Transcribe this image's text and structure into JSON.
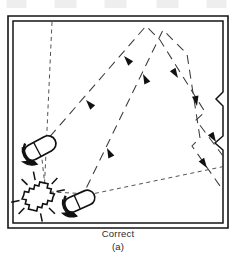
{
  "figure": {
    "caption_main": "Correct",
    "caption_sub": "(a)",
    "type": "lighting-plan-diagram"
  },
  "colors": {
    "ink": "#1a1a1a",
    "wall": "#141414",
    "ray": "#3a3a3a",
    "background": "#ffffff",
    "caption": "#2b2b2b"
  },
  "room": {
    "name": "room-outline",
    "outer": {
      "x": 8,
      "y": 16,
      "width": 220,
      "height": 212
    },
    "inner": {
      "x": 12,
      "y": 20,
      "width": 212,
      "height": 204
    },
    "wall_style": "double-line",
    "wall_notches": [
      {
        "name": "right-wall-notch-upper",
        "y": 96,
        "depth": 7
      },
      {
        "name": "right-wall-notch-lower",
        "y": 140,
        "depth": 7
      }
    ]
  },
  "fixtures": [
    {
      "name": "spotlight-upper-left",
      "label": "spotlight",
      "x": 40,
      "y": 148,
      "rotation": -28,
      "aim": "up-right"
    },
    {
      "name": "spotlight-lower-center",
      "label": "spotlight",
      "x": 80,
      "y": 201,
      "rotation": -24,
      "aim": "up-right"
    }
  ],
  "glare_source": {
    "name": "sparkle-lamp",
    "label": "bright-source",
    "x": 38,
    "y": 196,
    "rotation": -30
  },
  "rays": [
    {
      "name": "ray-path-upper",
      "kind": "reflected-beam",
      "points": [
        [
          40,
          148
        ],
        [
          146,
          26
        ],
        [
          160,
          40
        ],
        [
          205,
          112
        ],
        [
          196,
          120
        ],
        [
          226,
          160
        ]
      ],
      "arrows": [
        {
          "x": 86,
          "y": 100,
          "angle": -49
        },
        {
          "x": 122,
          "y": 58,
          "angle": -49
        },
        {
          "x": 176,
          "y": 76,
          "angle": 58
        },
        {
          "x": 214,
          "y": 140,
          "angle": 58
        }
      ]
    },
    {
      "name": "ray-path-lower",
      "kind": "reflected-beam",
      "points": [
        [
          80,
          201
        ],
        [
          163,
          30
        ],
        [
          187,
          54
        ],
        [
          200,
          138
        ],
        [
          192,
          146
        ],
        [
          220,
          186
        ]
      ],
      "arrows": [
        {
          "x": 108,
          "y": 146,
          "angle": -64
        },
        {
          "x": 142,
          "y": 76,
          "angle": -64
        },
        {
          "x": 196,
          "y": 104,
          "angle": 80
        },
        {
          "x": 208,
          "y": 166,
          "angle": 56
        }
      ]
    },
    {
      "name": "sight-line-vertical",
      "kind": "dashed-sight-line",
      "points": [
        [
          52,
          22
        ],
        [
          44,
          196
        ]
      ]
    },
    {
      "name": "sight-line-to-upper-fixture",
      "kind": "dashed-sight-line",
      "points": [
        [
          44,
          196
        ],
        [
          40,
          148
        ]
      ]
    },
    {
      "name": "sight-line-horizontal",
      "kind": "dashed-sight-line",
      "points": [
        [
          46,
          194
        ],
        [
          226,
          166
        ]
      ]
    },
    {
      "name": "sight-line-to-lower-fixture",
      "kind": "dashed-sight-line",
      "points": [
        [
          46,
          194
        ],
        [
          88,
          196
        ]
      ]
    }
  ]
}
